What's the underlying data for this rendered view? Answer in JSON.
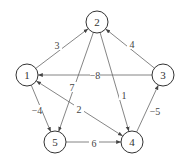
{
  "diagram": {
    "type": "directed weighted graph",
    "nodes": [
      {
        "id": "1",
        "label": "1",
        "x": 27,
        "y": 75
      },
      {
        "id": "2",
        "label": "2",
        "x": 97,
        "y": 22
      },
      {
        "id": "3",
        "label": "3",
        "x": 163,
        "y": 75
      },
      {
        "id": "4",
        "label": "4",
        "x": 132,
        "y": 142
      },
      {
        "id": "5",
        "label": "5",
        "x": 55,
        "y": 142
      }
    ],
    "edges": [
      {
        "from": "1",
        "to": "2",
        "weight": "3",
        "lx": 57,
        "ly": 45
      },
      {
        "from": "3",
        "to": "2",
        "weight": "4",
        "lx": 132,
        "ly": 44
      },
      {
        "from": "3",
        "to": "1",
        "weight": "−8",
        "lx": 95,
        "ly": 75
      },
      {
        "from": "2",
        "to": "5",
        "weight": "7",
        "lx": 72,
        "ly": 87
      },
      {
        "from": "2",
        "to": "4",
        "weight": "1",
        "lx": 124,
        "ly": 95
      },
      {
        "from": "1",
        "to": "4",
        "weight": "2",
        "lx": 79,
        "ly": 109,
        "bidirectional": true
      },
      {
        "from": "1",
        "to": "5",
        "weight": "−4",
        "lx": 37,
        "ly": 110
      },
      {
        "from": "5",
        "to": "4",
        "weight": "6",
        "lx": 94,
        "ly": 143
      },
      {
        "from": "4",
        "to": "3",
        "weight": "−5",
        "lx": 155,
        "ly": 111
      }
    ]
  }
}
